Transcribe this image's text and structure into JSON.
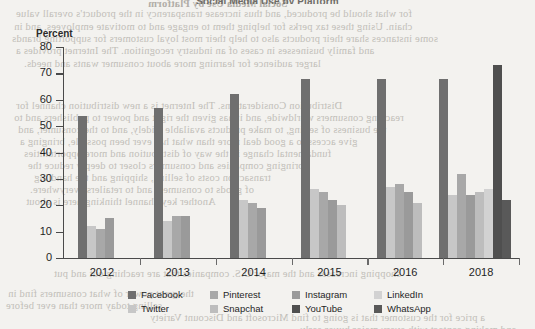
{
  "document": {
    "background_color": "#f3f2ef",
    "bleed_text": [
      {
        "text": "Social Media Use by Platform",
        "x": 148,
        "y": -2,
        "bold": true
      },
      {
        "text": "for what should be produced, and thus increase transparency in the product's overall value",
        "x": 16,
        "y": 8
      },
      {
        "text": "chain. Using these tax perks for helping them to engage and to motivate employees, and in",
        "x": 14,
        "y": 21
      },
      {
        "text": "some instances share their products also to help their most loyal customers for supporting brands",
        "x": 12,
        "y": 33
      },
      {
        "text": "and family businesses in cases of an industry recognition. The Internet provides a",
        "x": 16,
        "y": 45
      },
      {
        "text": "larger audience for learning more about consumer wants and needs.",
        "x": 24,
        "y": 58
      },
      {
        "text": "Distribution Considerations. The Internet is a new distribution channel for",
        "x": 16,
        "y": 100
      },
      {
        "text": "reaching consumers worldwide, and it has given the right and power to publishers and to",
        "x": 14,
        "y": 112
      },
      {
        "text": "the business of selling, to make products available widely, and to the consumer, and",
        "x": 18,
        "y": 124
      },
      {
        "text": "give access to a good deal more than what has ever been possible, bringing a",
        "x": 20,
        "y": 136
      },
      {
        "text": "fundamental change in the way of distribution and more opportunities",
        "x": 24,
        "y": 148
      },
      {
        "text": "bringing companies and consumers closer to deeply reduce the",
        "x": 28,
        "y": 160
      },
      {
        "text": "transaction costs of selling, shipping and the handling",
        "x": 34,
        "y": 172
      },
      {
        "text": "of goods to consumers and to retailers everywhere.",
        "x": 30,
        "y": 184
      },
      {
        "text": "Another key channel thinking here is about",
        "x": 26,
        "y": 196
      },
      {
        "text": "the great power of what consumers find in",
        "x": 8,
        "y": 288
      },
      {
        "text": "selling today more than ever before",
        "x": 6,
        "y": 300
      },
      {
        "text": "shopping increases and the major U.S. companies that are reaching out and put",
        "x": 54,
        "y": 268
      },
      {
        "text": "a price for the customer that is going to find Microsoft and Discount Variety",
        "x": 150,
        "y": 312
      },
      {
        "text": "and making contact with every major buyer early",
        "x": 300,
        "y": 324
      }
    ]
  },
  "chart_data": {
    "type": "bar",
    "title": "Social Media Use by Platform",
    "xlabel": "",
    "ylabel": "Percent",
    "ylim": [
      0,
      80
    ],
    "ytick_step": 10,
    "yticks": [
      0,
      10,
      20,
      30,
      40,
      50,
      60,
      70,
      80
    ],
    "grid": false,
    "legend_position": "bottom",
    "categories": [
      "2012",
      "2013",
      "2014",
      "2015",
      "2016",
      "2018"
    ],
    "series": [
      {
        "name": "Facebook",
        "color": "#6f6f6f",
        "values": [
          54,
          57,
          62,
          68,
          68,
          68
        ]
      },
      {
        "name": "Twitter",
        "color": "#c7c7c7",
        "values": [
          12,
          14,
          22,
          26,
          27,
          24
        ]
      },
      {
        "name": "Pinterest",
        "color": "#a8a8a8",
        "values": [
          11,
          16,
          21,
          25,
          28,
          32
        ]
      },
      {
        "name": "Instagram",
        "color": "#9a9a9a",
        "values": [
          15,
          16,
          19,
          22,
          25,
          24
        ]
      },
      {
        "name": "Snapchat",
        "color": "#bdbdbd",
        "values": [
          null,
          null,
          null,
          20,
          21,
          25
        ]
      },
      {
        "name": "LinkedIn",
        "color": "#d2d2d2",
        "values": [
          null,
          null,
          null,
          null,
          null,
          26
        ]
      },
      {
        "name": "YouTube",
        "color": "#4f4f4f",
        "values": [
          null,
          null,
          null,
          null,
          null,
          73
        ]
      },
      {
        "name": "WhatsApp",
        "color": "#595959",
        "values": [
          null,
          null,
          null,
          null,
          null,
          22
        ]
      }
    ]
  },
  "legend": {
    "row1": [
      {
        "label": "Facebook",
        "color": "#6f6f6f"
      },
      {
        "label": "Pinterest",
        "color": "#a8a8a8"
      },
      {
        "label": "Instagram",
        "color": "#9a9a9a"
      },
      {
        "label": "LinkedIn",
        "color": "#d2d2d2"
      }
    ],
    "row2": [
      {
        "label": "Twitter",
        "color": "#c7c7c7"
      },
      {
        "label": "Snapchat",
        "color": "#bdbdbd"
      },
      {
        "label": "YouTube",
        "color": "#4f4f4f"
      },
      {
        "label": "WhatsApp",
        "color": "#595959"
      }
    ]
  }
}
